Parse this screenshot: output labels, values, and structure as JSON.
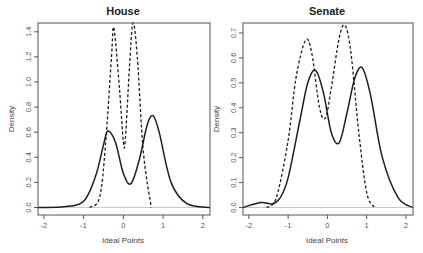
{
  "chart_data": [
    {
      "type": "line",
      "title": "House",
      "xlabel": "Ideal Points",
      "ylabel": "Density",
      "xlim": [
        -2.15,
        2.18
      ],
      "ylim": [
        -0.06,
        1.47
      ],
      "xticks": [
        -2,
        -1,
        0,
        1,
        2
      ],
      "xtick_labels": [
        "-2",
        "-1",
        "0",
        "1",
        "2"
      ],
      "yticks": [
        0.0,
        0.2,
        0.4,
        0.6,
        0.8,
        1.0,
        1.2,
        1.4
      ],
      "ytick_labels": [
        "0.0",
        "0.2",
        "0.4",
        "0.6",
        "0.8",
        "1.0",
        "1.2",
        "1.4"
      ],
      "grid": false,
      "hline": 0,
      "series": [
        {
          "name": "solid",
          "style": "solid",
          "x": [
            -2.15,
            -1.5,
            -1.0,
            -0.7,
            -0.5,
            -0.39,
            -0.2,
            0.0,
            0.19,
            0.4,
            0.6,
            0.75,
            0.9,
            1.2,
            1.6,
            2.18
          ],
          "values": [
            0.0,
            0.005,
            0.05,
            0.25,
            0.5,
            0.61,
            0.52,
            0.27,
            0.19,
            0.38,
            0.66,
            0.73,
            0.6,
            0.2,
            0.03,
            0.0
          ]
        },
        {
          "name": "dashed",
          "style": "dashed",
          "x": [
            -0.85,
            -0.6,
            -0.45,
            -0.3,
            -0.24,
            -0.1,
            0.0,
            0.05,
            0.15,
            0.24,
            0.35,
            0.5,
            0.7
          ],
          "values": [
            0.0,
            0.08,
            0.5,
            1.2,
            1.43,
            0.95,
            0.52,
            0.55,
            1.1,
            1.47,
            1.2,
            0.45,
            0.0
          ]
        }
      ]
    },
    {
      "type": "line",
      "title": "Senate",
      "xlabel": "Ideal Points",
      "ylabel": "Density",
      "xlim": [
        -2.15,
        2.18
      ],
      "ylim": [
        -0.03,
        0.74
      ],
      "xticks": [
        -2,
        -1,
        0,
        1,
        2
      ],
      "xtick_labels": [
        "-2",
        "-1",
        "0",
        "1",
        "2"
      ],
      "yticks": [
        0.0,
        0.1,
        0.2,
        0.3,
        0.4,
        0.5,
        0.6,
        0.7
      ],
      "ytick_labels": [
        "0.0",
        "0.1",
        "0.2",
        "0.3",
        "0.4",
        "0.5",
        "0.6",
        "0.7"
      ],
      "grid": false,
      "hline": 0,
      "series": [
        {
          "name": "solid",
          "style": "solid",
          "x": [
            -2.15,
            -1.7,
            -1.4,
            -1.2,
            -1.0,
            -0.7,
            -0.5,
            -0.3,
            -0.1,
            0.1,
            0.3,
            0.5,
            0.7,
            0.89,
            1.1,
            1.4,
            1.8,
            2.18
          ],
          "values": [
            0.0,
            0.02,
            0.015,
            0.04,
            0.12,
            0.35,
            0.5,
            0.55,
            0.46,
            0.3,
            0.26,
            0.38,
            0.52,
            0.56,
            0.45,
            0.2,
            0.04,
            0.0
          ]
        },
        {
          "name": "dashed",
          "style": "dashed",
          "x": [
            -1.55,
            -1.3,
            -1.0,
            -0.8,
            -0.56,
            -0.4,
            -0.2,
            -0.05,
            0.1,
            0.3,
            0.45,
            0.6,
            0.8,
            1.0,
            1.2
          ],
          "values": [
            0.0,
            0.04,
            0.27,
            0.52,
            0.67,
            0.62,
            0.4,
            0.36,
            0.48,
            0.68,
            0.73,
            0.62,
            0.3,
            0.06,
            0.0
          ]
        }
      ]
    }
  ]
}
